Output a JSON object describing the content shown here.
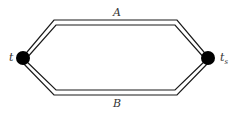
{
  "diagram": {
    "paths": [
      {
        "id": "A",
        "label": "A",
        "position": "top"
      },
      {
        "id": "B",
        "label": "B",
        "position": "bottom"
      }
    ],
    "nodes": [
      {
        "id": "left",
        "label": "t",
        "sub": ""
      },
      {
        "id": "right",
        "label": "t",
        "sub": "s"
      }
    ],
    "colors": {
      "line": "#1a1a1a",
      "node": "#000000",
      "background": "#ffffff"
    }
  }
}
